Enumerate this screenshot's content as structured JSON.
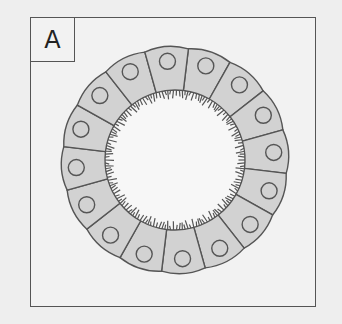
{
  "panel": {
    "label": "A"
  },
  "diagram": {
    "center": [
      175,
      160
    ],
    "outer_radius": 112,
    "inner_radius": 70,
    "cell_count": 16,
    "nucleus_radius": 8,
    "colors": {
      "cell_fill": "#d2d2d2",
      "stroke": "#555555",
      "lumen": "#f7f7f7",
      "background": "#eeeeee",
      "microvilli": "#555555"
    }
  }
}
